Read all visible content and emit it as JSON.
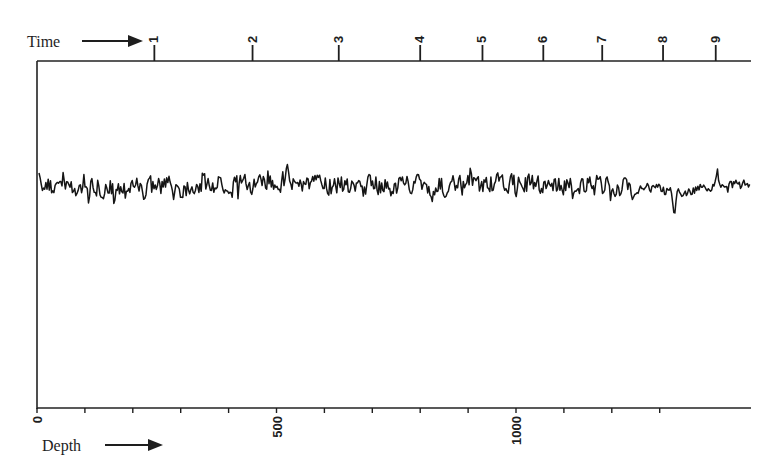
{
  "chart_data": {
    "type": "line",
    "title": "",
    "xlabel": "Depth",
    "x2label": "Time",
    "ylabel": "",
    "grid": false,
    "legend": null,
    "x_axis": {
      "label": "Depth",
      "range": [
        0,
        1490
      ],
      "major_ticks": [
        0,
        500,
        1000
      ],
      "major_tick_labels": [
        "0",
        "500",
        "1000"
      ],
      "minor_tick_step": 100,
      "label_rotation": -90
    },
    "top_axis": {
      "label": "Time",
      "ticks": [
        {
          "label": "1",
          "depth": 245
        },
        {
          "label": "2",
          "depth": 450
        },
        {
          "label": "3",
          "depth": 630
        },
        {
          "label": "4",
          "depth": 800
        },
        {
          "label": "5",
          "depth": 930
        },
        {
          "label": "6",
          "depth": 1057
        },
        {
          "label": "7",
          "depth": 1180
        },
        {
          "label": "8",
          "depth": 1307
        },
        {
          "label": "9",
          "depth": 1417
        }
      ]
    },
    "series": [
      {
        "name": "signal",
        "description": "High-frequency noisy record across depth 0-1490; roughly stationary amplitude, slightly smoother after ~1250, with a pronounced negative spike near depth ~1330 (just past Time 8).",
        "baseline_level": 0.0,
        "amplitude_approx": 1.0,
        "notable_features": [
          {
            "depth": 520,
            "type": "positive spike"
          },
          {
            "depth": 1330,
            "type": "negative spike"
          },
          {
            "depth": 1420,
            "type": "positive spike"
          }
        ]
      }
    ]
  },
  "labels": {
    "time": "Time",
    "depth": "Depth"
  }
}
